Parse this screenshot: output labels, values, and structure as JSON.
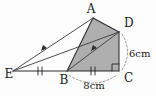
{
  "figure": {
    "type": "geometry-diagram",
    "background_color": "#fdfdfd",
    "shaded_color": "#ababab",
    "line_color": "#2b2b2b",
    "dashed_color": "#7d7d7d"
  },
  "vertices": [
    {
      "name": "A",
      "label": "A",
      "x": 93,
      "y": 18,
      "label_x": 91,
      "label_y": 13
    },
    {
      "name": "D",
      "label": "D",
      "x": 119,
      "y": 32,
      "label_x": 124,
      "label_y": 27
    },
    {
      "name": "C",
      "label": "C",
      "x": 119,
      "y": 71,
      "label_x": 124,
      "label_y": 80
    },
    {
      "name": "B",
      "label": "B",
      "x": 67,
      "y": 71,
      "label_x": 64,
      "label_y": 82
    },
    {
      "name": "E",
      "label": "E",
      "x": 13,
      "y": 71,
      "label_x": 7,
      "label_y": 77
    }
  ],
  "segments": [
    {
      "name": "segment-E-A",
      "from": "E",
      "to": "A",
      "style": "solid"
    },
    {
      "name": "segment-E-D",
      "from": "E",
      "to": "D",
      "style": "solid"
    },
    {
      "name": "segment-E-B",
      "from": "E",
      "to": "B",
      "style": "solid"
    },
    {
      "name": "segment-A-B",
      "from": "A",
      "to": "B",
      "style": "solid"
    },
    {
      "name": "segment-A-D",
      "from": "A",
      "to": "D",
      "style": "solid"
    },
    {
      "name": "segment-B-D",
      "from": "B",
      "to": "D",
      "style": "solid"
    },
    {
      "name": "segment-B-C",
      "from": "B",
      "to": "C",
      "style": "solid"
    },
    {
      "name": "segment-D-C",
      "from": "D",
      "to": "C",
      "style": "solid"
    }
  ],
  "shaded_region": {
    "name": "shaded-quadrilateral-ADCB",
    "vertices": [
      "A",
      "D",
      "C",
      "B"
    ]
  },
  "measurements": [
    {
      "name": "measure-8cm",
      "label": "8cm",
      "value": 8,
      "unit": "cm",
      "segment": "B-C",
      "label_x": 93,
      "label_y": 86
    },
    {
      "name": "measure-6cm",
      "label": "6cm",
      "value": 6,
      "unit": "cm",
      "segment": "D-C",
      "label_x": 130,
      "label_y": 55
    }
  ],
  "marks": {
    "right_angle": {
      "name": "right-angle-at-C",
      "vertex": "C",
      "size": 7
    },
    "tick_marks": [
      {
        "name": "tick-mark-EB",
        "segment": "E-B",
        "count": 2,
        "x": 40,
        "y": 71
      },
      {
        "name": "tick-mark-BC",
        "segment": "B-C",
        "count": 2,
        "x": 93,
        "y": 71
      }
    ],
    "parallel_arrows": [
      {
        "name": "arrow-marker-EA",
        "segment": "E-A",
        "count": 1
      },
      {
        "name": "arrow-marker-BD",
        "segment": "B-D",
        "count": 1
      }
    ]
  }
}
